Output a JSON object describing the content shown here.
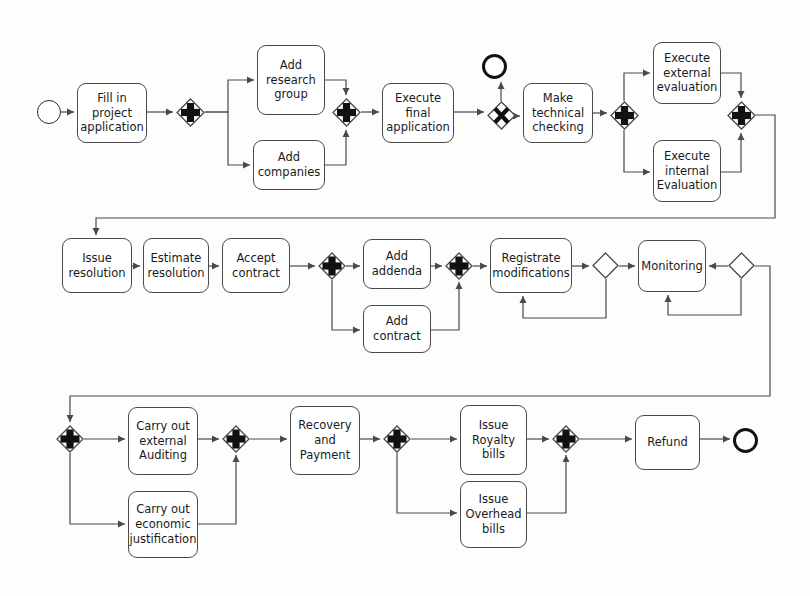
{
  "diagram": {
    "type": "bpmn-process-flow",
    "width": 810,
    "height": 596,
    "background_color": "#fdfdfc",
    "stroke_color": "#4a4a4a",
    "text_color": "#1a1a1a"
  },
  "nodes": [
    {
      "id": "start",
      "kind": "start-event",
      "label": "",
      "x": 37,
      "y": 100,
      "w": 24,
      "h": 24
    },
    {
      "id": "fill-in-project-application",
      "kind": "task",
      "label": "Fill in\nproject\napplication",
      "x": 77,
      "y": 83,
      "w": 70,
      "h": 60
    },
    {
      "id": "gw-split-1",
      "kind": "parallel-gateway",
      "label": "+",
      "x": 176,
      "y": 98,
      "w": 29,
      "h": 29
    },
    {
      "id": "add-research-group",
      "kind": "task",
      "label": "Add\nresearch\ngroup",
      "x": 257,
      "y": 45,
      "w": 68,
      "h": 70
    },
    {
      "id": "add-companies",
      "kind": "task",
      "label": "Add\ncompanies",
      "x": 253,
      "y": 140,
      "w": 72,
      "h": 50
    },
    {
      "id": "gw-join-1",
      "kind": "parallel-gateway",
      "label": "+",
      "x": 332,
      "y": 98,
      "w": 29,
      "h": 29
    },
    {
      "id": "execute-final-application",
      "kind": "task",
      "label": "Execute\nfinal\napplication",
      "x": 382,
      "y": 83,
      "w": 72,
      "h": 60
    },
    {
      "id": "gw-xor-1",
      "kind": "exclusive-gateway",
      "label": "X",
      "x": 487,
      "y": 101,
      "w": 29,
      "h": 29
    },
    {
      "id": "end-rejected",
      "kind": "end-event",
      "label": "",
      "x": 482,
      "y": 54,
      "w": 25,
      "h": 25
    },
    {
      "id": "make-technical-checking",
      "kind": "task",
      "label": "Make\ntechnical\nchecking",
      "x": 523,
      "y": 83,
      "w": 70,
      "h": 60
    },
    {
      "id": "gw-split-2",
      "kind": "parallel-gateway",
      "label": "+",
      "x": 610,
      "y": 101,
      "w": 29,
      "h": 29
    },
    {
      "id": "execute-external-evaluation",
      "kind": "task",
      "label": "Execute\nexternal\nevaluation",
      "x": 653,
      "y": 42,
      "w": 68,
      "h": 62
    },
    {
      "id": "execute-internal-evaluation",
      "kind": "task",
      "label": "Execute\ninternal\nEvaluation",
      "x": 653,
      "y": 140,
      "w": 68,
      "h": 62
    },
    {
      "id": "gw-join-2",
      "kind": "parallel-gateway",
      "label": "+",
      "x": 727,
      "y": 101,
      "w": 29,
      "h": 29
    },
    {
      "id": "issue-resolution",
      "kind": "task",
      "label": "Issue\nresolution",
      "x": 62,
      "y": 238,
      "w": 70,
      "h": 55
    },
    {
      "id": "estimate-resolution",
      "kind": "task",
      "label": "Estimate\nresolution",
      "x": 143,
      "y": 238,
      "w": 66,
      "h": 55
    },
    {
      "id": "accept-contract",
      "kind": "task",
      "label": "Accept\ncontract",
      "x": 222,
      "y": 238,
      "w": 68,
      "h": 55
    },
    {
      "id": "gw-split-3",
      "kind": "parallel-gateway",
      "label": "+",
      "x": 318,
      "y": 252,
      "w": 28,
      "h": 28
    },
    {
      "id": "add-addenda",
      "kind": "task",
      "label": "Add\naddenda",
      "x": 363,
      "y": 239,
      "w": 68,
      "h": 50
    },
    {
      "id": "add-contract",
      "kind": "task",
      "label": "Add\ncontract",
      "x": 363,
      "y": 305,
      "w": 68,
      "h": 48
    },
    {
      "id": "gw-join-3",
      "kind": "parallel-gateway",
      "label": "+",
      "x": 445,
      "y": 252,
      "w": 28,
      "h": 28
    },
    {
      "id": "registrate-modifications",
      "kind": "task",
      "label": "Registrate\nmodifications",
      "x": 490,
      "y": 238,
      "w": 82,
      "h": 55
    },
    {
      "id": "gw-xor-2",
      "kind": "exclusive-gateway-blank",
      "label": "",
      "x": 592,
      "y": 252,
      "w": 27,
      "h": 27
    },
    {
      "id": "monitoring",
      "kind": "task",
      "label": "Monitoring",
      "x": 638,
      "y": 240,
      "w": 68,
      "h": 52
    },
    {
      "id": "gw-xor-3",
      "kind": "exclusive-gateway-blank",
      "label": "",
      "x": 728,
      "y": 252,
      "w": 27,
      "h": 27
    },
    {
      "id": "gw-split-4",
      "kind": "parallel-gateway",
      "label": "+",
      "x": 56,
      "y": 425,
      "w": 28,
      "h": 28
    },
    {
      "id": "carry-out-external-auditing",
      "kind": "task",
      "label": "Carry out\nexternal\nAuditing",
      "x": 128,
      "y": 407,
      "w": 70,
      "h": 68
    },
    {
      "id": "carry-out-economic-justification",
      "kind": "task",
      "label": "Carry out\neconomic\njustification",
      "x": 128,
      "y": 491,
      "w": 70,
      "h": 67
    },
    {
      "id": "gw-join-4",
      "kind": "parallel-gateway",
      "label": "+",
      "x": 222,
      "y": 425,
      "w": 28,
      "h": 28
    },
    {
      "id": "recovery-and-payment",
      "kind": "task",
      "label": "Recovery\nand\nPayment",
      "x": 290,
      "y": 406,
      "w": 70,
      "h": 69
    },
    {
      "id": "gw-split-5",
      "kind": "parallel-gateway",
      "label": "+",
      "x": 383,
      "y": 425,
      "w": 28,
      "h": 28
    },
    {
      "id": "issue-royalty-bills",
      "kind": "task",
      "label": "Issue\nRoyalty\nbills",
      "x": 460,
      "y": 405,
      "w": 67,
      "h": 70
    },
    {
      "id": "issue-overhead-bills",
      "kind": "task",
      "label": "Issue\nOverhead\nbills",
      "x": 460,
      "y": 481,
      "w": 67,
      "h": 67
    },
    {
      "id": "gw-join-5",
      "kind": "parallel-gateway",
      "label": "+",
      "x": 552,
      "y": 425,
      "w": 28,
      "h": 28
    },
    {
      "id": "refund",
      "kind": "task",
      "label": "Refund",
      "x": 635,
      "y": 415,
      "w": 65,
      "h": 55
    },
    {
      "id": "end-final",
      "kind": "end-event",
      "label": "",
      "x": 733,
      "y": 428,
      "w": 25,
      "h": 25
    }
  ],
  "edges": [
    {
      "from": "start",
      "to": "fill-in-project-application",
      "path": "M 61,112 L 74,112"
    },
    {
      "from": "fill-in-project-application",
      "to": "gw-split-1",
      "path": "M 147,112 L 173,112"
    },
    {
      "from": "gw-split-1",
      "to": "add-research-group",
      "path": "M 205,112 L 228,112 L 228,80 L 254,80"
    },
    {
      "from": "gw-split-1",
      "to": "add-companies",
      "path": "M 205,112 L 228,112 L 228,165 L 250,165"
    },
    {
      "from": "add-research-group",
      "to": "gw-join-1",
      "path": "M 325,80 L 346,80 L 346,95"
    },
    {
      "from": "add-companies",
      "to": "gw-join-1",
      "path": "M 325,165 L 346,165 L 346,130"
    },
    {
      "from": "gw-join-1",
      "to": "execute-final-application",
      "path": "M 361,112 L 379,112"
    },
    {
      "from": "execute-final-application",
      "to": "gw-xor-1",
      "path": "M 454,112 L 484,112"
    },
    {
      "from": "gw-xor-1",
      "to": "end-rejected",
      "path": "M 501,101 L 501,82"
    },
    {
      "from": "gw-xor-1",
      "to": "make-technical-checking",
      "path": "M 516,116 L 520,116"
    },
    {
      "from": "make-technical-checking",
      "to": "gw-split-2",
      "path": "M 593,113 L 607,113"
    },
    {
      "from": "gw-split-2",
      "to": "execute-external-evaluation",
      "path": "M 624,101 L 624,73 L 650,73"
    },
    {
      "from": "gw-split-2",
      "to": "execute-internal-evaluation",
      "path": "M 624,130 L 624,172 L 650,172"
    },
    {
      "from": "execute-external-evaluation",
      "to": "gw-join-2",
      "path": "M 721,73 L 741,73 L 741,98"
    },
    {
      "from": "execute-internal-evaluation",
      "to": "gw-join-2",
      "path": "M 721,172 L 741,172 L 741,133"
    },
    {
      "from": "gw-join-2",
      "to": "issue-resolution",
      "path": "M 756,115 L 775,115 L 775,218 L 96,218 L 96,235"
    },
    {
      "from": "issue-resolution",
      "to": "estimate-resolution",
      "path": "M 132,266 L 140,266"
    },
    {
      "from": "estimate-resolution",
      "to": "accept-contract",
      "path": "M 209,266 L 219,266"
    },
    {
      "from": "accept-contract",
      "to": "gw-split-3",
      "path": "M 290,266 L 315,266"
    },
    {
      "from": "gw-split-3",
      "to": "add-addenda",
      "path": "M 346,266 L 360,266"
    },
    {
      "from": "gw-split-3",
      "to": "add-contract",
      "path": "M 332,280 L 332,330 L 360,330"
    },
    {
      "from": "add-addenda",
      "to": "gw-join-3",
      "path": "M 431,266 L 442,266"
    },
    {
      "from": "add-contract",
      "to": "gw-join-3",
      "path": "M 431,330 L 459,330 L 459,282"
    },
    {
      "from": "gw-join-3",
      "to": "registrate-modifications",
      "path": "M 473,266 L 487,266"
    },
    {
      "from": "registrate-modifications",
      "to": "gw-xor-2",
      "path": "M 572,266 L 589,266"
    },
    {
      "from": "gw-xor-2",
      "to": "registrate-modifications",
      "path": "M 606,279 L 606,318 L 523,318 L 523,296"
    },
    {
      "from": "gw-xor-2",
      "to": "monitoring",
      "path": "M 619,266 L 635,266"
    },
    {
      "from": "gw-xor-3",
      "to": "monitoring",
      "path": "M 728,266 L 709,266"
    },
    {
      "from": "gw-xor-3",
      "to": "monitoring-loop",
      "path": "M 741,279 L 741,315 L 668,315 L 668,295"
    },
    {
      "from": "gw-xor-3",
      "to": "gw-split-4",
      "path": "M 755,266 L 770,266 L 770,396 L 70,396 L 70,422"
    },
    {
      "from": "gw-split-4",
      "to": "carry-out-external-auditing",
      "path": "M 84,439 L 125,439"
    },
    {
      "from": "gw-split-4",
      "to": "carry-out-economic-justification",
      "path": "M 70,453 L 70,524 L 125,524"
    },
    {
      "from": "carry-out-external-auditing",
      "to": "gw-join-4",
      "path": "M 198,439 L 219,439"
    },
    {
      "from": "carry-out-economic-justification",
      "to": "gw-join-4",
      "path": "M 198,524 L 236,524 L 236,455"
    },
    {
      "from": "gw-join-4",
      "to": "recovery-and-payment",
      "path": "M 250,439 L 287,439"
    },
    {
      "from": "recovery-and-payment",
      "to": "gw-split-5",
      "path": "M 360,439 L 380,439"
    },
    {
      "from": "gw-split-5",
      "to": "issue-royalty-bills",
      "path": "M 411,439 L 457,439"
    },
    {
      "from": "gw-split-5",
      "to": "issue-overhead-bills",
      "path": "M 397,453 L 397,513 L 457,513"
    },
    {
      "from": "issue-royalty-bills",
      "to": "gw-join-5",
      "path": "M 527,439 L 549,439"
    },
    {
      "from": "issue-overhead-bills",
      "to": "gw-join-5",
      "path": "M 527,513 L 566,513 L 566,455"
    },
    {
      "from": "gw-join-5",
      "to": "refund",
      "path": "M 580,439 L 632,439"
    },
    {
      "from": "refund",
      "to": "end-final",
      "path": "M 700,439 L 730,439"
    }
  ]
}
